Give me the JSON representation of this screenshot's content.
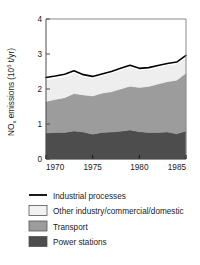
{
  "chart_data": {
    "type": "area",
    "title": "",
    "subtitle": "",
    "xlabel": "",
    "ylabel": "NO_x emissions (10^6 t/yr)",
    "ylabel_parts": {
      "pre": "NO",
      "sub": "x",
      "mid": " emissions (10",
      "sup": "6",
      "post": " t/yr)"
    },
    "stacked": true,
    "xlim": [
      1970,
      1985
    ],
    "ylim": [
      0,
      4
    ],
    "xticks": [
      1970,
      1975,
      1980,
      1985
    ],
    "xticklabels": [
      "1970",
      "1975",
      "1980",
      "1985"
    ],
    "yticks": [
      0,
      1,
      2,
      3,
      4
    ],
    "yticklabels": [
      "0",
      "1",
      "2",
      "3",
      "4"
    ],
    "grid": false,
    "legend_position": "below",
    "x": [
      1970,
      1971,
      1972,
      1973,
      1974,
      1975,
      1976,
      1977,
      1978,
      1979,
      1980,
      1981,
      1982,
      1983,
      1984,
      1985
    ],
    "series": [
      {
        "name": "Power stations",
        "color": "#4d4d4d",
        "values": [
          0.74,
          0.76,
          0.76,
          0.8,
          0.77,
          0.71,
          0.76,
          0.77,
          0.79,
          0.83,
          0.78,
          0.76,
          0.76,
          0.77,
          0.72,
          0.8
        ]
      },
      {
        "name": "Transport",
        "color": "#9c9c9c",
        "values": [
          0.9,
          0.94,
          0.99,
          1.07,
          1.06,
          1.09,
          1.12,
          1.15,
          1.21,
          1.25,
          1.26,
          1.31,
          1.38,
          1.44,
          1.53,
          1.65
        ]
      },
      {
        "name": "Other industry/commercial/domestic",
        "color": "#eeeeee",
        "values": [
          0.62,
          0.6,
          0.6,
          0.58,
          0.52,
          0.5,
          0.49,
          0.52,
          0.53,
          0.54,
          0.49,
          0.48,
          0.47,
          0.46,
          0.46,
          0.45
        ]
      },
      {
        "name": "Industrial processes",
        "color": "#ffffff",
        "line_color": "#000000",
        "values": [
          0.07,
          0.07,
          0.07,
          0.07,
          0.06,
          0.06,
          0.06,
          0.06,
          0.06,
          0.06,
          0.06,
          0.06,
          0.06,
          0.06,
          0.06,
          0.06
        ]
      }
    ],
    "totals": [
      2.33,
      2.37,
      2.42,
      2.52,
      2.41,
      2.36,
      2.43,
      2.5,
      2.59,
      2.68,
      2.59,
      2.61,
      2.67,
      2.73,
      2.77,
      2.96
    ]
  },
  "legend": {
    "items": [
      {
        "label": "Industrial processes",
        "swatch": "line",
        "color": "#000000"
      },
      {
        "label": "Other industry/commercial/domestic",
        "swatch": "box",
        "color": "#f2f2f2"
      },
      {
        "label": "Transport",
        "swatch": "box",
        "color": "#9c9c9c"
      },
      {
        "label": "Power stations",
        "swatch": "box",
        "color": "#4d4d4d"
      }
    ]
  }
}
